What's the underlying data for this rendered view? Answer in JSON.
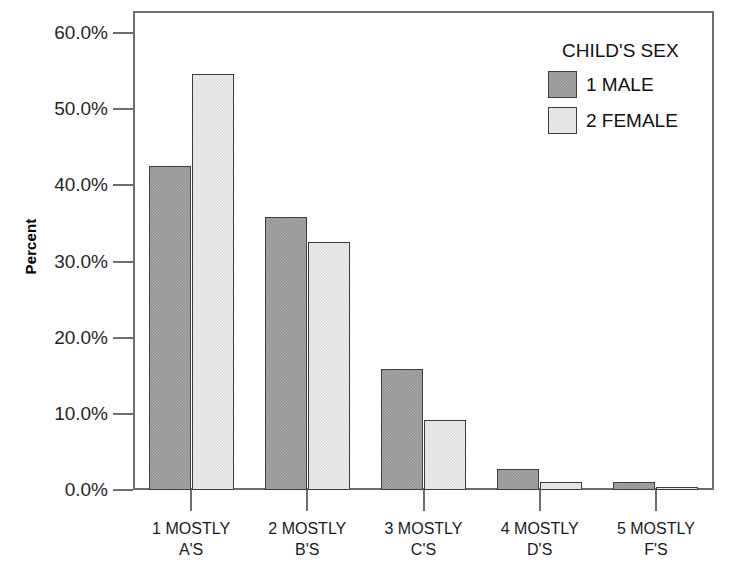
{
  "chart_data": {
    "type": "bar",
    "title": "",
    "xlabel": "",
    "ylabel": "Percent",
    "ylim": [
      0,
      60
    ],
    "grid": false,
    "legend_position": "top-right",
    "legend_title": "CHILD'S SEX",
    "categories": [
      "1 MOSTLY A'S",
      "2 MOSTLY B'S",
      "3 MOSTLY C'S",
      "4 MOSTLY D'S",
      "5 MOSTLY F'S"
    ],
    "category_lines": [
      [
        "1 MOSTLY",
        "A'S"
      ],
      [
        "2 MOSTLY",
        "B'S"
      ],
      [
        "3 MOSTLY",
        "C'S"
      ],
      [
        "4 MOSTLY",
        "D'S"
      ],
      [
        "5 MOSTLY",
        "F'S"
      ]
    ],
    "ytick_labels": [
      "0.0%",
      "10.0%",
      "20.0%",
      "30.0%",
      "40.0%",
      "50.0%",
      "60.0%"
    ],
    "ytick_values": [
      0,
      10,
      20,
      30,
      40,
      50,
      60
    ],
    "series": [
      {
        "name": "1 MALE",
        "color": "#949494",
        "values": [
          42.5,
          35.8,
          15.9,
          2.7,
          1.0
        ]
      },
      {
        "name": "2 FEMALE",
        "color": "#dedede",
        "values": [
          54.6,
          32.5,
          9.2,
          1.0,
          0.4
        ]
      }
    ]
  },
  "legend": {
    "title": "CHILD'S SEX",
    "entries": [
      {
        "label": "1 MALE",
        "swatch": "male"
      },
      {
        "label": "2 FEMALE",
        "swatch": "female"
      }
    ]
  },
  "axes": {
    "y_title": "Percent"
  },
  "colors": {
    "bar_male": "#949494",
    "bar_female": "#dedede",
    "bar_outline": "#3d3d3d",
    "axis": "#6e6e6e",
    "text": "#1a1a1a",
    "background": "#ffffff"
  }
}
